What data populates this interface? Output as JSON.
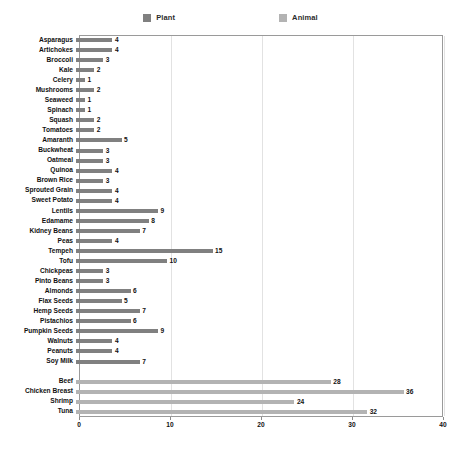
{
  "chart_data": {
    "type": "bar",
    "orientation": "horizontal",
    "title": "",
    "xlabel": "",
    "ylabel": "",
    "xlim": [
      0,
      40
    ],
    "xticks": [
      0,
      10,
      20,
      30,
      40
    ],
    "grid": "vertical",
    "legend_position": "top-center",
    "series": [
      {
        "name": "Plant",
        "color": "#808080"
      },
      {
        "name": "Animal",
        "color": "#b3b3b3"
      }
    ],
    "categories": [
      "Asparagus",
      "Artichokes",
      "Broccoli",
      "Kale",
      "Celery",
      "Mushrooms",
      "Seaweed",
      "Spinach",
      "Squash",
      "Tomatoes",
      "Amaranth",
      "Buckwheat",
      "Oatmeal",
      "Quinoa",
      "Brown Rice",
      "Sprouted Grain",
      "Sweet Potato",
      "Lentils",
      "Edamame",
      "Kidney Beans",
      "Peas",
      "Tempeh",
      "Tofu",
      "Chickpeas",
      "Pinto Beans",
      "Almonds",
      "Flax Seeds",
      "Hemp Seeds",
      "Pistachios",
      "Pumpkin Seeds",
      "Walnuts",
      "Peanuts",
      "Soy Milk",
      "",
      "Beef",
      "Chicken Breast",
      "Shrimp",
      "Tuna"
    ],
    "rows": [
      {
        "label": "Asparagus",
        "value": 4,
        "series": "Plant"
      },
      {
        "label": "Artichokes",
        "value": 4,
        "series": "Plant"
      },
      {
        "label": "Broccoli",
        "value": 3,
        "series": "Plant"
      },
      {
        "label": "Kale",
        "value": 2,
        "series": "Plant"
      },
      {
        "label": "Celery",
        "value": 1,
        "series": "Plant"
      },
      {
        "label": "Mushrooms",
        "value": 2,
        "series": "Plant"
      },
      {
        "label": "Seaweed",
        "value": 1,
        "series": "Plant"
      },
      {
        "label": "Spinach",
        "value": 1,
        "series": "Plant"
      },
      {
        "label": "Squash",
        "value": 2,
        "series": "Plant"
      },
      {
        "label": "Tomatoes",
        "value": 2,
        "series": "Plant"
      },
      {
        "label": "Amaranth",
        "value": 5,
        "series": "Plant"
      },
      {
        "label": "Buckwheat",
        "value": 3,
        "series": "Plant"
      },
      {
        "label": "Oatmeal",
        "value": 3,
        "series": "Plant"
      },
      {
        "label": "Quinoa",
        "value": 4,
        "series": "Plant"
      },
      {
        "label": "Brown Rice",
        "value": 3,
        "series": "Plant"
      },
      {
        "label": "Sprouted Grain",
        "value": 4,
        "series": "Plant"
      },
      {
        "label": "Sweet Potato",
        "value": 4,
        "series": "Plant"
      },
      {
        "label": "Lentils",
        "value": 9,
        "series": "Plant"
      },
      {
        "label": "Edamame",
        "value": 8,
        "series": "Plant"
      },
      {
        "label": "Kidney Beans",
        "value": 7,
        "series": "Plant"
      },
      {
        "label": "Peas",
        "value": 4,
        "series": "Plant"
      },
      {
        "label": "Tempeh",
        "value": 15,
        "series": "Plant"
      },
      {
        "label": "Tofu",
        "value": 10,
        "series": "Plant"
      },
      {
        "label": "Chickpeas",
        "value": 3,
        "series": "Plant"
      },
      {
        "label": "Pinto Beans",
        "value": 3,
        "series": "Plant"
      },
      {
        "label": "Almonds",
        "value": 6,
        "series": "Plant"
      },
      {
        "label": "Flax Seeds",
        "value": 5,
        "series": "Plant"
      },
      {
        "label": "Hemp Seeds",
        "value": 7,
        "series": "Plant"
      },
      {
        "label": "Pistachios",
        "value": 6,
        "series": "Plant"
      },
      {
        "label": "Pumpkin Seeds",
        "value": 9,
        "series": "Plant"
      },
      {
        "label": "Walnuts",
        "value": 4,
        "series": "Plant"
      },
      {
        "label": "Peanuts",
        "value": 4,
        "series": "Plant"
      },
      {
        "label": "Soy Milk",
        "value": 7,
        "series": "Plant"
      },
      {
        "label": "",
        "value": null,
        "series": null
      },
      {
        "label": "Beef",
        "value": 28,
        "series": "Animal"
      },
      {
        "label": "Chicken Breast",
        "value": 36,
        "series": "Animal"
      },
      {
        "label": "Shrimp",
        "value": 24,
        "series": "Animal"
      },
      {
        "label": "Tuna",
        "value": 32,
        "series": "Animal"
      }
    ]
  }
}
